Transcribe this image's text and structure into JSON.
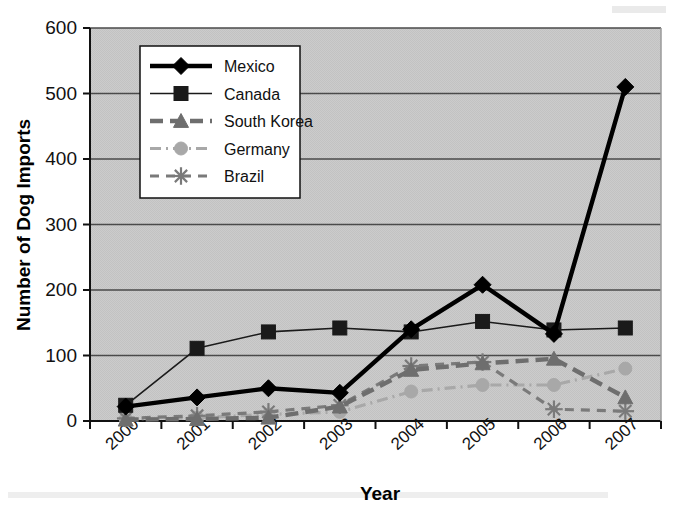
{
  "chart_data": {
    "type": "line",
    "title": "",
    "xlabel": "Year",
    "ylabel": "Number of Dog Imports",
    "categories": [
      "2000",
      "2001",
      "2002",
      "2003",
      "2004",
      "2005",
      "2006",
      "2007"
    ],
    "ylim": [
      0,
      600
    ],
    "ytick_values": [
      0,
      100,
      200,
      300,
      400,
      500,
      600
    ],
    "ytick_labels": [
      "0",
      "100",
      "200",
      "300",
      "400",
      "500",
      "600"
    ],
    "grid": "horizontal",
    "legend_position": "upper-left-inside",
    "plot_background": "#c9c9c9",
    "series": [
      {
        "name": "Mexico",
        "marker": "diamond",
        "line_style": "solid",
        "line_width": "thick",
        "color": "#000000",
        "values": [
          22,
          36,
          50,
          43,
          140,
          208,
          133,
          510
        ]
      },
      {
        "name": "Canada",
        "marker": "square",
        "line_style": "solid",
        "line_width": "thin",
        "color": "#1a1a1a",
        "values": [
          24,
          111,
          136,
          142,
          136,
          152,
          139,
          142
        ]
      },
      {
        "name": "South Korea",
        "marker": "triangle",
        "line_style": "dashed",
        "line_width": "thick",
        "color": "#6e6e6e",
        "values": [
          2,
          3,
          5,
          22,
          78,
          88,
          95,
          36
        ]
      },
      {
        "name": "Germany",
        "marker": "circle",
        "line_style": "dash-dot",
        "line_width": "medium",
        "color": "#a8a8a8",
        "values": [
          3,
          5,
          10,
          14,
          45,
          55,
          55,
          80
        ]
      },
      {
        "name": "Brazil",
        "marker": "asterisk",
        "line_style": "dashed",
        "line_width": "medium",
        "color": "#7a7a7a",
        "values": [
          4,
          8,
          14,
          24,
          84,
          90,
          18,
          15
        ]
      }
    ]
  },
  "legend": {
    "entries": [
      {
        "label": "Mexico"
      },
      {
        "label": "Canada"
      },
      {
        "label": "South Korea"
      },
      {
        "label": "Germany"
      },
      {
        "label": "Brazil"
      }
    ]
  }
}
